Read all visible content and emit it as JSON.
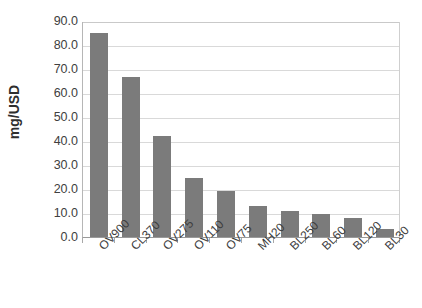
{
  "chart_data": {
    "type": "bar",
    "title": "",
    "subtitle": "",
    "xlabel": "",
    "ylabel": "mg/USD",
    "categories": [
      "OV900",
      "CL370",
      "OV275",
      "OV110",
      "OV75",
      "MH20",
      "BL250",
      "BL60",
      "BL120",
      "BL30"
    ],
    "values": [
      85.0,
      66.5,
      42.0,
      24.5,
      19.0,
      13.0,
      11.0,
      9.5,
      8.0,
      3.5
    ],
    "ylim": [
      0.0,
      90.0
    ],
    "ytick_step": 10.0,
    "ytick_labels": [
      "90.0",
      "80.0",
      "70.0",
      "60.0",
      "50.0",
      "40.0",
      "30.0",
      "20.0",
      "10.0",
      "0.0"
    ],
    "grid": "horizontal",
    "legend": "none",
    "bar_color": "#7b7b7b",
    "gridline_color": "#d9d9d9",
    "axis_color": "#9a9a9a",
    "text_color": "#3d3d3d"
  }
}
